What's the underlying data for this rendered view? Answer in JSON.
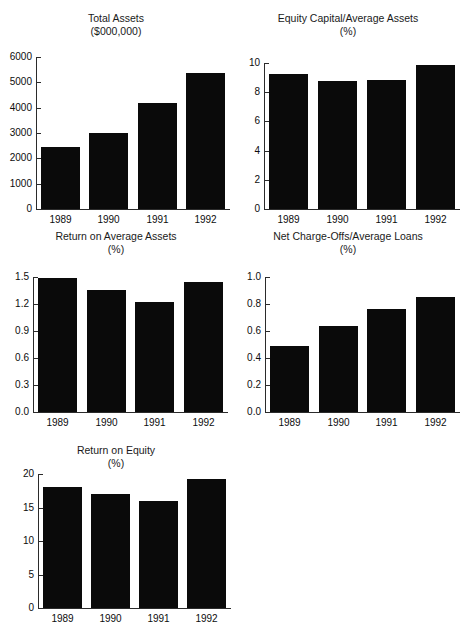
{
  "figure": {
    "categories": [
      "1989",
      "1990",
      "1991",
      "1992"
    ],
    "bar_color": "#0a0a0a",
    "axis_color": "#2b2b2b",
    "background": "#ffffff"
  },
  "charts": [
    {
      "id": "total-assets",
      "title_line1": "Total Assets",
      "title_line2": "($000,000)",
      "yticks": [
        "0",
        "1000",
        "2000",
        "3000",
        "4000",
        "5000",
        "6000"
      ],
      "values": [
        2450,
        2990,
        4180,
        5350
      ]
    },
    {
      "id": "equity-capital-average-assets",
      "title_line1": "Equity Capital/Average Assets",
      "title_line2": "(%)",
      "yticks": [
        "0",
        "2",
        "4",
        "6",
        "8",
        "10"
      ],
      "values": [
        9.25,
        8.75,
        8.85,
        9.85
      ]
    },
    {
      "id": "return-on-average-assets",
      "title_line1": "Return on Average Assets",
      "title_line2": "(%)",
      "yticks": [
        "0.0",
        "0.3",
        "0.6",
        "0.9",
        "1.2",
        "1.5"
      ],
      "values": [
        1.49,
        1.35,
        1.22,
        1.44
      ]
    },
    {
      "id": "net-charge-offs-average-loans",
      "title_line1": "Net Charge-Offs/Average Loans",
      "title_line2": "(%)",
      "yticks": [
        "0.0",
        "0.2",
        "0.4",
        "0.6",
        "0.8",
        "1.0"
      ],
      "values": [
        0.49,
        0.64,
        0.76,
        0.85
      ]
    },
    {
      "id": "return-on-equity",
      "title_line1": "Return on Equity",
      "title_line2": "(%)",
      "yticks": [
        "0",
        "5",
        "10",
        "15",
        "20"
      ],
      "values": [
        18.0,
        17.0,
        16.0,
        19.2
      ]
    }
  ],
  "chart_data": [
    {
      "type": "bar",
      "title": "Total Assets ($000,000)",
      "xlabel": "",
      "ylabel": "($000,000)",
      "categories": [
        "1989",
        "1990",
        "1991",
        "1992"
      ],
      "values": [
        2450,
        2990,
        4180,
        5350
      ],
      "ylim": [
        0,
        6000
      ],
      "yticks": [
        0,
        1000,
        2000,
        3000,
        4000,
        5000,
        6000
      ],
      "grid": false,
      "legend": "none"
    },
    {
      "type": "bar",
      "title": "Equity Capital/Average Assets (%)",
      "xlabel": "",
      "ylabel": "(%)",
      "categories": [
        "1989",
        "1990",
        "1991",
        "1992"
      ],
      "values": [
        9.25,
        8.75,
        8.85,
        9.85
      ],
      "ylim": [
        0,
        10
      ],
      "yticks": [
        0,
        2,
        4,
        6,
        8,
        10
      ],
      "grid": false,
      "legend": "none"
    },
    {
      "type": "bar",
      "title": "Return on Average Assets (%)",
      "xlabel": "",
      "ylabel": "(%)",
      "categories": [
        "1989",
        "1990",
        "1991",
        "1992"
      ],
      "values": [
        1.49,
        1.35,
        1.22,
        1.44
      ],
      "ylim": [
        0.0,
        1.5
      ],
      "yticks": [
        0.0,
        0.3,
        0.6,
        0.9,
        1.2,
        1.5
      ],
      "grid": false,
      "legend": "none"
    },
    {
      "type": "bar",
      "title": "Net Charge-Offs/Average Loans (%)",
      "xlabel": "",
      "ylabel": "(%)",
      "categories": [
        "1989",
        "1990",
        "1991",
        "1992"
      ],
      "values": [
        0.49,
        0.64,
        0.76,
        0.85
      ],
      "ylim": [
        0.0,
        1.0
      ],
      "yticks": [
        0.0,
        0.2,
        0.4,
        0.6,
        0.8,
        1.0
      ],
      "grid": false,
      "legend": "none"
    },
    {
      "type": "bar",
      "title": "Return on Equity (%)",
      "xlabel": "",
      "ylabel": "(%)",
      "categories": [
        "1989",
        "1990",
        "1991",
        "1992"
      ],
      "values": [
        18.0,
        17.0,
        16.0,
        19.2
      ],
      "ylim": [
        0,
        20
      ],
      "yticks": [
        0,
        5,
        10,
        15,
        20
      ],
      "grid": false,
      "legend": "none"
    }
  ]
}
